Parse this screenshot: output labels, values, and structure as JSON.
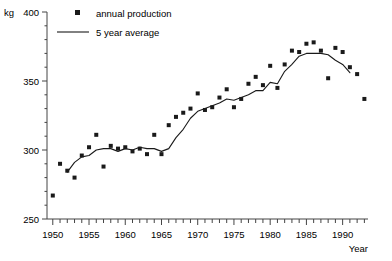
{
  "chart_data": {
    "type": "scatter",
    "title": "",
    "xlabel": "Year",
    "ylabel": "kg",
    "xlim": [
      1949.2,
      1993.5
    ],
    "ylim": [
      250,
      400
    ],
    "grid": false,
    "legend_position": "top-left-inside",
    "y_ticks": [
      250,
      300,
      350,
      400
    ],
    "y_minor_tick_step": 10,
    "x_ticks": [
      1950,
      1955,
      1960,
      1965,
      1970,
      1975,
      1980,
      1985,
      1990
    ],
    "x_minor_tick_step": 1,
    "series": [
      {
        "name": "annual production",
        "type": "scatter",
        "marker": "square",
        "color": "#1a1a1a",
        "x": [
          1950,
          1951,
          1952,
          1953,
          1954,
          1955,
          1956,
          1957,
          1958,
          1959,
          1960,
          1961,
          1962,
          1963,
          1964,
          1965,
          1966,
          1967,
          1968,
          1969,
          1970,
          1971,
          1972,
          1973,
          1974,
          1975,
          1976,
          1977,
          1978,
          1979,
          1980,
          1981,
          1982,
          1983,
          1984,
          1985,
          1986,
          1987,
          1988,
          1989,
          1990,
          1991,
          1992,
          1993
        ],
        "values": [
          267,
          290,
          285,
          280,
          296,
          302,
          311,
          288,
          303,
          301,
          302,
          299,
          301,
          297,
          311,
          297,
          318,
          324,
          327,
          330,
          341,
          329,
          331,
          338,
          344,
          331,
          337,
          348,
          353,
          347,
          361,
          345,
          362,
          372,
          371,
          377,
          378,
          372,
          352,
          374,
          371,
          360,
          355,
          337
        ]
      },
      {
        "name": "5 year average",
        "type": "line",
        "color": "#1a1a1a",
        "x": [
          1952,
          1953,
          1954,
          1955,
          1956,
          1957,
          1958,
          1959,
          1960,
          1961,
          1962,
          1963,
          1964,
          1965,
          1966,
          1967,
          1968,
          1969,
          1970,
          1971,
          1972,
          1973,
          1974,
          1975,
          1976,
          1977,
          1978,
          1979,
          1980,
          1981,
          1982,
          1983,
          1984,
          1985,
          1986,
          1987,
          1988,
          1989,
          1990,
          1991
        ],
        "values": [
          284,
          291,
          295,
          296,
          300,
          301,
          301,
          299,
          301,
          300,
          302,
          301,
          301,
          299,
          301,
          309,
          315,
          323,
          328,
          330,
          332,
          334,
          337,
          336,
          338,
          340,
          343,
          343,
          349,
          348,
          357,
          362,
          368,
          370,
          370,
          370,
          369,
          365,
          362,
          356
        ]
      }
    ]
  },
  "legend": {
    "items": [
      {
        "label": "annual production",
        "marker": "square"
      },
      {
        "label": "5 year average",
        "marker": "line"
      }
    ]
  },
  "axes": {
    "y_unit_label": "kg",
    "y_tick_labels": [
      "250",
      "300",
      "350",
      "400"
    ],
    "x_tick_labels": [
      "1950",
      "1955",
      "1960",
      "1965",
      "1970",
      "1975",
      "1980",
      "1985",
      "1990"
    ],
    "x_axis_title": "Year"
  }
}
